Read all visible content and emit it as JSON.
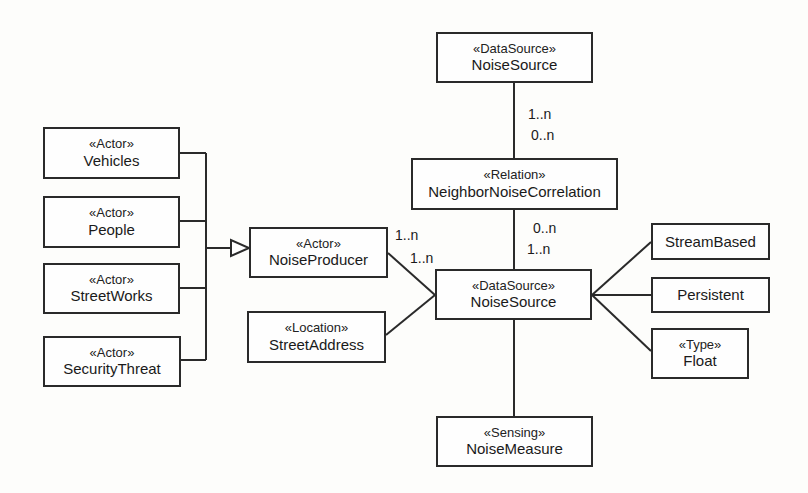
{
  "diagram": {
    "type": "uml-class-diagram",
    "nodes": {
      "noise_source_top": {
        "stereotype": "«DataSource»",
        "name": "NoiseSource"
      },
      "neighbor_corr": {
        "stereotype": "«Relation»",
        "name": "NeighborNoiseCorrelation"
      },
      "noise_source_main": {
        "stereotype": "«DataSource»",
        "name": "NoiseSource"
      },
      "noise_measure": {
        "stereotype": "«Sensing»",
        "name": "NoiseMeasure"
      },
      "noise_producer": {
        "stereotype": "«Actor»",
        "name": "NoiseProducer"
      },
      "street_address": {
        "stereotype": "«Location»",
        "name": "StreetAddress"
      },
      "vehicles": {
        "stereotype": "«Actor»",
        "name": "Vehicles"
      },
      "people": {
        "stereotype": "«Actor»",
        "name": "People"
      },
      "street_works": {
        "stereotype": "«Actor»",
        "name": "StreetWorks"
      },
      "security_threat": {
        "stereotype": "«Actor»",
        "name": "SecurityThreat"
      },
      "stream_based": {
        "name": "StreamBased"
      },
      "persistent": {
        "name": "Persistent"
      },
      "float_type": {
        "stereotype": "«Type»",
        "name": "Float"
      }
    },
    "multiplicities": {
      "top_to_corr_upper": "1..n",
      "top_to_corr_lower": "0..n",
      "corr_to_main_upper": "0..n",
      "corr_to_main_lower": "1..n",
      "producer_side": "1..n",
      "source_side": "1..n"
    },
    "edges": [
      {
        "from": "noise_source_top",
        "to": "neighbor_corr",
        "kind": "association"
      },
      {
        "from": "neighbor_corr",
        "to": "noise_source_main",
        "kind": "association"
      },
      {
        "from": "noise_source_main",
        "to": "noise_measure",
        "kind": "association"
      },
      {
        "from": "noise_producer",
        "to": "noise_source_main",
        "kind": "association"
      },
      {
        "from": "street_address",
        "to": "noise_source_main",
        "kind": "association"
      },
      {
        "from": "noise_source_main",
        "to": "stream_based",
        "kind": "association"
      },
      {
        "from": "noise_source_main",
        "to": "persistent",
        "kind": "association"
      },
      {
        "from": "noise_source_main",
        "to": "float_type",
        "kind": "association"
      },
      {
        "from": "vehicles",
        "to": "noise_producer",
        "kind": "generalization"
      },
      {
        "from": "people",
        "to": "noise_producer",
        "kind": "generalization"
      },
      {
        "from": "street_works",
        "to": "noise_producer",
        "kind": "generalization"
      },
      {
        "from": "security_threat",
        "to": "noise_producer",
        "kind": "generalization"
      }
    ],
    "colors": {
      "line": "#2a2a2a",
      "background": "#fdfdfb"
    }
  }
}
